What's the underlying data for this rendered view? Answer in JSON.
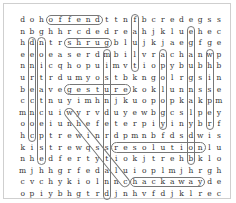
{
  "puzzle": {
    "rows": [
      "dohoffendttnfbcredegss",
      "nbghhrcdedreahjkluehec",
      "hdntrshrugblujkjaegfge",
      "eeoeaserdmbilvrachanwp",
      "nnicqhopuimvtiopybubhb",
      "urtrdumyostbkngolrgsin",
      "beavegesturekoklunnsse",
      "cctnuyimhnjkuopopkakpm",
      "mncuiwyrvduyewbgcslpey",
      "ooeiunhefeterpiyinybrf",
      "hcptrewinrdpmnbfdsdwis",
      "kistrewqssresolutionlu",
      "nhedfertytiokjtrehbklo",
      "mjhhgrfedaluioplmjhrgh",
      "cvchykiolnnchackawayde",
      "opiybhgtrdjnhvfdjklrec"
    ],
    "found_words": [
      {
        "word": "offend",
        "dir": "horizontal",
        "row": 0,
        "col": 3,
        "len": 6
      },
      {
        "word": "fault",
        "dir": "vertical",
        "row": 0,
        "col": 12,
        "len": 5
      },
      {
        "word": "shrug",
        "dir": "horizontal",
        "row": 2,
        "col": 5,
        "len": 5
      },
      {
        "word": "concerned",
        "dir": "vertical",
        "row": 2,
        "col": 1,
        "len": 9
      },
      {
        "word": "expectation",
        "dir": "vertical",
        "row": 2,
        "col": 2,
        "len": 11
      },
      {
        "word": "misunderstand",
        "dir": "vertical",
        "row": 3,
        "col": 9,
        "len": 13
      },
      {
        "word": "gesture",
        "dir": "horizontal",
        "row": 6,
        "col": 5,
        "len": 7
      },
      {
        "word": "whistle",
        "dir": "diagonal",
        "row": 8,
        "col": 5,
        "len": 7
      },
      {
        "word": "apology",
        "dir": "vertical",
        "row": 3,
        "col": 15,
        "len": 7
      },
      {
        "word": "exchange",
        "dir": "vertical",
        "row": 1,
        "col": 18,
        "len": 12
      },
      {
        "word": "whisper",
        "dir": "vertical",
        "row": 3,
        "col": 20,
        "len": 7
      },
      {
        "word": "resolution",
        "dir": "horizontal",
        "row": 11,
        "col": 10,
        "len": 10
      },
      {
        "word": "hackaway",
        "dir": "horizontal",
        "row": 14,
        "col": 12,
        "len": 8
      }
    ]
  }
}
